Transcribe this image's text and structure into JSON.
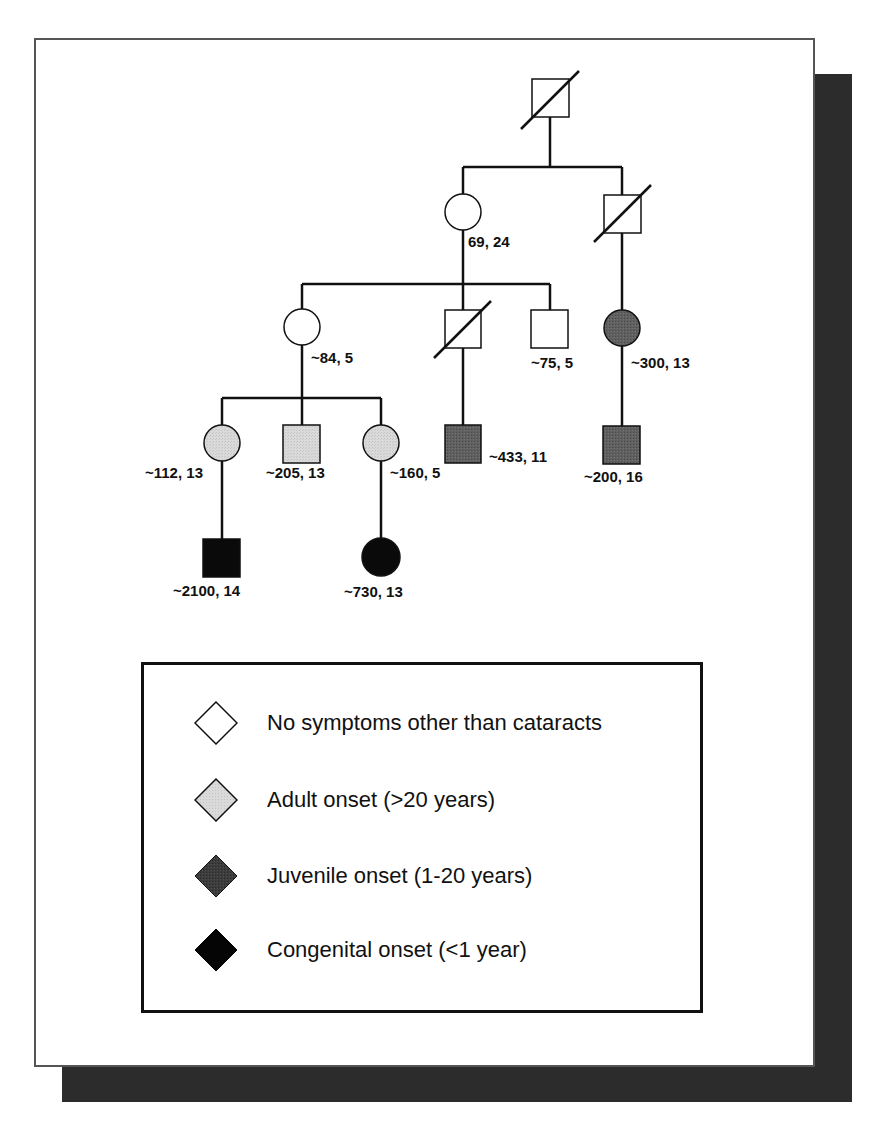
{
  "colors": {
    "unaffected": "#ffffff",
    "adult_onset": "#d6d6d6",
    "juvenile_onset": "#5e5e5e",
    "congenital_onset": "#0a0a0a",
    "line": "#111111",
    "shadow": "#2c2c2c"
  },
  "pedigree": {
    "individuals": [
      {
        "id": "g1-father",
        "sex": "male",
        "generation": 1,
        "status": "unaffected",
        "deceased": true,
        "label": ""
      },
      {
        "id": "g2-mother",
        "sex": "female",
        "generation": 2,
        "status": "unaffected",
        "deceased": false,
        "label": "69, 24"
      },
      {
        "id": "g2-brother",
        "sex": "male",
        "generation": 2,
        "status": "unaffected",
        "deceased": true,
        "label": ""
      },
      {
        "id": "g3-daughter",
        "sex": "female",
        "generation": 3,
        "status": "unaffected",
        "deceased": false,
        "label": "~84, 5"
      },
      {
        "id": "g3-son-deceased",
        "sex": "male",
        "generation": 3,
        "status": "unaffected",
        "deceased": true,
        "label": ""
      },
      {
        "id": "g3-son",
        "sex": "male",
        "generation": 3,
        "status": "unaffected",
        "deceased": false,
        "label": "~75, 5"
      },
      {
        "id": "g3-cousin",
        "sex": "female",
        "generation": 3,
        "status": "juvenile_onset",
        "deceased": false,
        "label": "~300, 13"
      },
      {
        "id": "g4-girl-1",
        "sex": "female",
        "generation": 4,
        "status": "adult_onset",
        "deceased": false,
        "label": "~112, 13"
      },
      {
        "id": "g4-boy",
        "sex": "male",
        "generation": 4,
        "status": "adult_onset",
        "deceased": false,
        "label": "~205, 13"
      },
      {
        "id": "g4-girl-2",
        "sex": "female",
        "generation": 4,
        "status": "adult_onset",
        "deceased": false,
        "label": "~160, 5"
      },
      {
        "id": "g4-son-of-deceased",
        "sex": "male",
        "generation": 4,
        "status": "juvenile_onset",
        "deceased": false,
        "label": "~433, 11"
      },
      {
        "id": "g4-son-of-cousin",
        "sex": "male",
        "generation": 4,
        "status": "juvenile_onset",
        "deceased": false,
        "label": "~200, 16"
      },
      {
        "id": "g5-boy",
        "sex": "male",
        "generation": 5,
        "status": "congenital_onset",
        "deceased": false,
        "label": "~2100, 14"
      },
      {
        "id": "g5-girl",
        "sex": "female",
        "generation": 5,
        "status": "congenital_onset",
        "deceased": false,
        "label": "~730, 13"
      }
    ]
  },
  "legend": {
    "items": [
      {
        "key": "unaffected",
        "label": "No symptoms other than cataracts"
      },
      {
        "key": "adult_onset",
        "label": "Adult onset (>20 years)"
      },
      {
        "key": "juvenile_onset",
        "label": "Juvenile onset (1-20 years)"
      },
      {
        "key": "congenital_onset",
        "label": "Congenital onset (<1 year)"
      }
    ]
  }
}
